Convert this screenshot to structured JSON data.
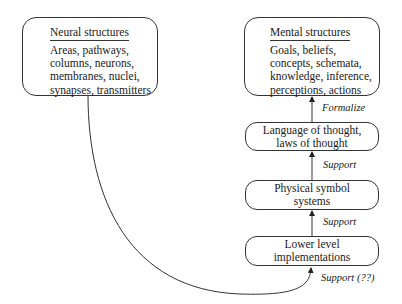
{
  "diagram": {
    "nodes": [
      {
        "id": "neural",
        "title": "Neural structures",
        "lines": [
          "Areas, pathways,",
          "columns, neurons,",
          "membranes, nuclei,",
          "synapses, transmitters"
        ]
      },
      {
        "id": "mental",
        "title": "Mental structures",
        "lines": [
          "Goals, beliefs,",
          "concepts, schemata,",
          "knowledge, inference,",
          "perceptions, actions"
        ]
      },
      {
        "id": "language",
        "lines": [
          "Language of thought,",
          "laws of thought"
        ]
      },
      {
        "id": "physical",
        "lines": [
          "Physical symbol",
          "systems"
        ]
      },
      {
        "id": "lower",
        "lines": [
          "Lower level",
          "implementations"
        ]
      }
    ],
    "edges": [
      {
        "from": "language",
        "to": "mental",
        "label": "Formalize"
      },
      {
        "from": "physical",
        "to": "language",
        "label": "Support"
      },
      {
        "from": "lower",
        "to": "physical",
        "label": "Support"
      },
      {
        "from": "neural",
        "to": "lower",
        "label": "Support (??)"
      }
    ],
    "colors": {
      "stroke": "#333333",
      "background": "#ffffff",
      "text": "#1a1a1a"
    }
  }
}
